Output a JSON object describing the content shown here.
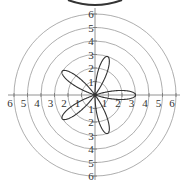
{
  "chart_data": {
    "type": "polar",
    "equation_form": "rose curve, 5 petals",
    "petals": 5,
    "amplitude": 3,
    "petal_angles_deg": [
      0,
      72,
      144,
      216,
      288
    ],
    "rmax_grid": 6,
    "grid_circles": [
      1,
      2,
      3,
      4,
      5,
      6
    ],
    "x_tick_labels": [
      "6",
      "5",
      "4",
      "3",
      "2",
      "1",
      "",
      "1",
      "2",
      "3",
      "4",
      "5",
      "6"
    ],
    "y_tick_labels_up": [
      "1",
      "2",
      "3",
      "4",
      "5",
      "6"
    ],
    "y_tick_labels_down": [
      "1",
      "2",
      "3",
      "4",
      "5",
      "6"
    ],
    "colors": {
      "grid": "#999999",
      "curve": "#333333",
      "axis": "#777777"
    }
  }
}
